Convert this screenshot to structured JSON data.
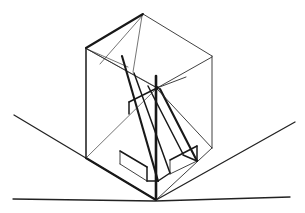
{
  "image": {
    "title": "Perspective line drawing of a sliced rectangular volume on a ground plane",
    "kind": "hand-drawn geometric construction sketch",
    "background_color": "#ffffff",
    "ink_color": "#181818",
    "width": 305,
    "height": 213
  },
  "scene": {
    "ground": {
      "name": "ground-plane",
      "horizon_line": {
        "label": "front horizontal ground line",
        "points": "13,199 155,201 290,197"
      },
      "left_receding_line": {
        "label": "left receding ground edge",
        "points": "14,115 156,200"
      },
      "right_receding_line": {
        "label": "right receding ground edge",
        "points": "156,200 295,122"
      },
      "corner_point": "156,200"
    },
    "volume": {
      "name": "main-prism",
      "description": "Upright rectangular block seen in two-point perspective, cut by two slanted planes",
      "vertices": {
        "top_apex": "143,14",
        "top_left": "86,48",
        "top_right": "212,56",
        "top_back": "155,88",
        "bottom_left": "86,158",
        "bottom_right": "212,148",
        "bottom_front": "156,200"
      }
    },
    "top_face": {
      "name": "top-face-quad",
      "outline": "143,14 86,48 155,88 212,56 143,14",
      "creases": [
        {
          "label": "apex-to-back-diagonal",
          "points": "143,14 155,88"
        },
        {
          "label": "apex-to-left-fan",
          "points": "143,14 101,64"
        },
        {
          "label": "left-corner-fan-a",
          "points": "86,48 127,66"
        },
        {
          "label": "left-corner-fan-b",
          "points": "86,48 155,88"
        },
        {
          "label": "right-back-edge",
          "points": "212,56 155,88"
        }
      ]
    },
    "slant_band": {
      "name": "slanted-slab",
      "description": "Diagonal slab sliding from upper area down to lower-right, with visible thickness",
      "left_edge": "123,57 158,180",
      "right_edge": "160,88 196,160",
      "inner_edge": "133,72 169,172",
      "foot_front": "158,180 196,160",
      "foot_step": "168,172 196,160"
    },
    "front_left_face": {
      "name": "front-left-face",
      "outline": "86,48 86,158 156,200 155,88 86,48"
    },
    "front_right_face": {
      "name": "front-right-face",
      "outline": "155,88 156,200 212,148 212,56 155,88"
    },
    "notch": {
      "name": "bottom-notch",
      "description": "Stepped notch at base where the slanted slab meets the ground",
      "segments": [
        "130,158 160,176",
        "160,176 160,190",
        "145,152 145,170",
        "178,152 178,168",
        "196,143 196,160"
      ]
    },
    "center_node": {
      "name": "center-convergence-point",
      "point": "157,88",
      "label": "vanishing/construction node where the rear vertical and the top diagonals meet"
    },
    "vertical_center_line": {
      "name": "rear-vertical-edge",
      "points": "156,75 156,200"
    }
  },
  "annotations": {
    "visible_text": [],
    "labels": []
  }
}
